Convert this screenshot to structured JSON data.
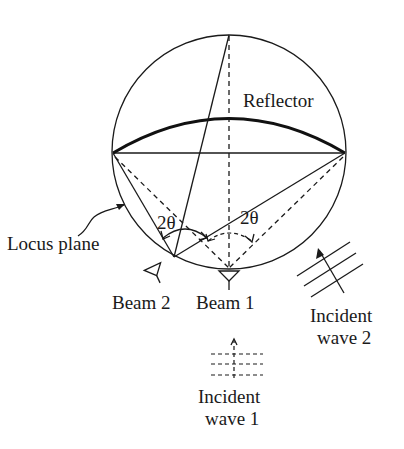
{
  "figure": {
    "labels": {
      "reflector": "Reflector",
      "locus_plane": "Locus plane",
      "beam_1": "Beam 1",
      "beam_2": "Beam 2",
      "angle_left": "2θ",
      "angle_right": "2θ",
      "incident_wave_1_line1": "Incident",
      "incident_wave_1_line2": "wave 1",
      "incident_wave_2_line1": "Incident",
      "incident_wave_2_line2": "wave 2"
    },
    "colors": {
      "ink": "#1a1a1a",
      "background": "#ffffff"
    },
    "icons": {
      "beam_1_feed": "feed-horn-icon",
      "beam_2_feed": "feed-horn-icon"
    }
  }
}
